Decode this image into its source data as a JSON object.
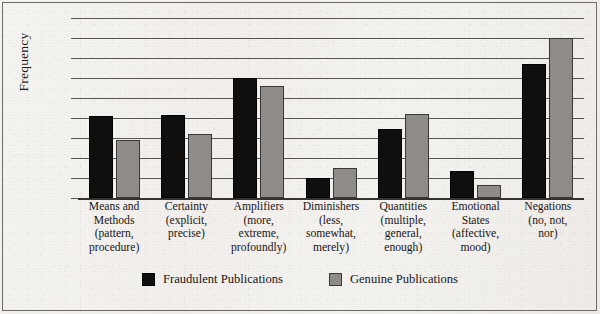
{
  "chart_data": {
    "type": "bar",
    "title": "",
    "subtitle": "",
    "xlabel": "",
    "ylabel": "Frequency",
    "ylim": [
      0,
      1800
    ],
    "ytick_step": 200,
    "yticks": [
      0,
      200,
      400,
      600,
      800,
      1000,
      1200,
      1400,
      1600,
      1800
    ],
    "ytick_labels": [
      "0",
      "200",
      "400",
      "600",
      "800",
      "1000",
      "1200",
      "1400",
      "1600",
      "1800"
    ],
    "grid": "horizontal",
    "legend_position": "bottom",
    "categories": [
      "Means and Methods (pattern, procedure)",
      "Certainty (explicit, precise)",
      "Amplifiers (more, extreme, profoundly)",
      "Diminishers (less, somewhat, merely)",
      "Quantities (multiple, general, enough)",
      "Emotional States (affective, mood)",
      "Negations (no, not, nor)"
    ],
    "category_lines": [
      [
        "Means and",
        "Methods",
        "(pattern,",
        "procedure)"
      ],
      [
        "Certainty",
        "(explicit,",
        "precise)"
      ],
      [
        "Amplifiers",
        "(more,",
        "extreme,",
        "profoundly)"
      ],
      [
        "Diminishers",
        "(less,",
        "somewhat,",
        "merely)"
      ],
      [
        "Quantities",
        "(multiple,",
        "general,",
        "enough)"
      ],
      [
        "Emotional",
        "States",
        "(affective,",
        "mood)"
      ],
      [
        "Negations",
        "(no, not,",
        "nor)"
      ]
    ],
    "series": [
      {
        "name": "Fraudulent Publications",
        "color": "#100f0e",
        "values": [
          820,
          830,
          1200,
          200,
          690,
          270,
          1340
        ]
      },
      {
        "name": "Genuine Publications",
        "color": "#8e8b88",
        "values": [
          580,
          640,
          1120,
          300,
          840,
          130,
          1600
        ]
      }
    ]
  },
  "legend": {
    "items": [
      {
        "label": "Fraudulent Publications",
        "swatch": "black-square-swatch"
      },
      {
        "label": "Genuine Publications",
        "swatch": "gray-square-swatch"
      }
    ]
  }
}
